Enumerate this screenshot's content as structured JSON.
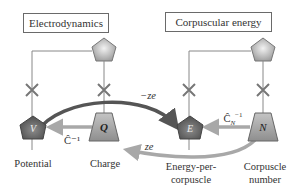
{
  "boxes": {
    "left": "Electrodynamics",
    "right": "Corpuscular energy"
  },
  "nodes": {
    "V": "V",
    "Q": "Q",
    "E": "E",
    "N": "N"
  },
  "labels": {
    "potential": "Potential",
    "charge": "Charge",
    "energy_line1": "Energy-per-",
    "energy_line2": "corpuscle",
    "corpuscle_line1": "Corpuscle",
    "corpuscle_line2": "number"
  },
  "arrows": {
    "minus_ze": "−ze",
    "ze": "ze",
    "c_inv": "Ĉ⁻¹",
    "cn_inv_base": "Ĉ",
    "cn_inv_sub": "N",
    "cn_inv_sup": "−1"
  },
  "colors": {
    "dark_arrow": "#555555",
    "light_arrow": "#a8a8a8",
    "node_fill": "#8a8a8a",
    "line": "#777777"
  }
}
